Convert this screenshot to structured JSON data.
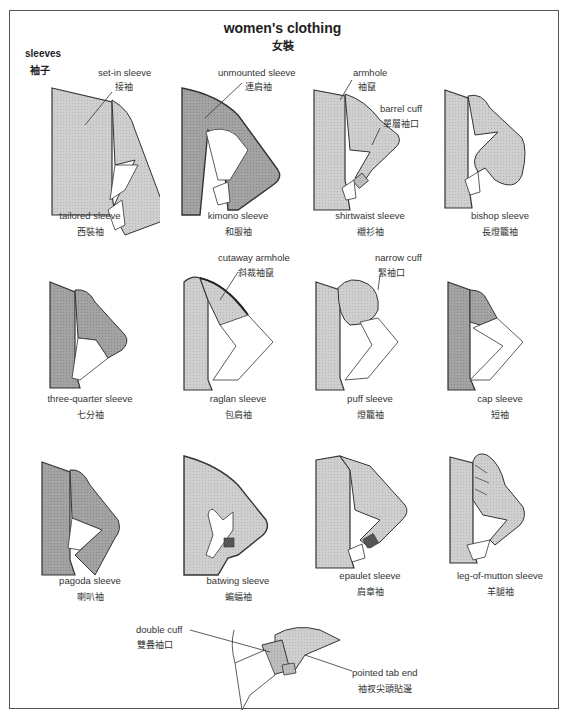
{
  "header": {
    "title": "women's clothing",
    "title_zh": "女裝",
    "section": "sleeves",
    "section_zh": "袖子"
  },
  "colors": {
    "fabric_light": "#c9c9c9",
    "fabric_dark": "#9a9a9a",
    "fabric_mid": "#b3b3b3",
    "outline": "#333333",
    "frame": "#555555",
    "skin": "#ffffff"
  },
  "sleeves": [
    {
      "name": "tailored sleeve",
      "name_zh": "西裝袖"
    },
    {
      "name": "kimono sleeve",
      "name_zh": "和服袖"
    },
    {
      "name": "shirtwaist sleeve",
      "name_zh": "襯衫袖"
    },
    {
      "name": "bishop sleeve",
      "name_zh": "長燈籠袖"
    },
    {
      "name": "three-quarter sleeve",
      "name_zh": "七分袖"
    },
    {
      "name": "raglan sleeve",
      "name_zh": "包肩袖"
    },
    {
      "name": "puff sleeve",
      "name_zh": "燈籠袖"
    },
    {
      "name": "cap sleeve",
      "name_zh": "短袖"
    },
    {
      "name": "pagoda sleeve",
      "name_zh": "喇叭袖"
    },
    {
      "name": "batwing sleeve",
      "name_zh": "蝙蝠袖"
    },
    {
      "name": "epaulet sleeve",
      "name_zh": "肩章袖"
    },
    {
      "name": "leg-of-mutton sleeve",
      "name_zh": "羊腿袖"
    }
  ],
  "callouts": {
    "set_in": {
      "label": "set-in sleeve",
      "label_zh": "接袖"
    },
    "unmounted": {
      "label": "unmounted sleeve",
      "label_zh": "連肩袖"
    },
    "armhole": {
      "label": "armhole",
      "label_zh": "袖竄"
    },
    "barrel_cuff": {
      "label": "barrel cuff",
      "label_zh": "單層袖口"
    },
    "cutaway_armhole": {
      "label": "cutaway armhole",
      "label_zh": "斜裁袖竄"
    },
    "narrow_cuff": {
      "label": "narrow cuff",
      "label_zh": "緊袖口"
    },
    "double_cuff": {
      "label": "double cuff",
      "label_zh": "雙疊袖口"
    },
    "pointed_tab_end": {
      "label": "pointed tab end",
      "label_zh": "袖衩尖頭貼邊"
    }
  }
}
